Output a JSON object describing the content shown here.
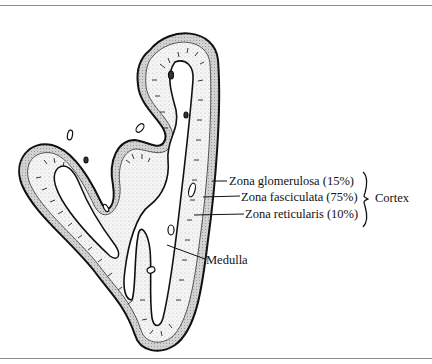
{
  "figure": {
    "labels": {
      "zona_glomerulosa": "Zona glomerulosa (15%)",
      "zona_fasciculata": "Zona fasciculata (75%)",
      "zona_reticularis": "Zona reticularis (10%)",
      "medulla": "Medulla",
      "cortex": "Cortex"
    },
    "cortex_zones": [
      {
        "name": "Zona glomerulosa",
        "percent": 15
      },
      {
        "name": "Zona fasciculata",
        "percent": 75
      },
      {
        "name": "Zona reticularis",
        "percent": 10
      }
    ],
    "colors": {
      "ink": "#111111",
      "rule": "#8a8a8a",
      "capsule_fill": "#cfcfcf",
      "cortex_fill": "#f4f4f4",
      "medulla_fill": "#ffffff"
    }
  }
}
